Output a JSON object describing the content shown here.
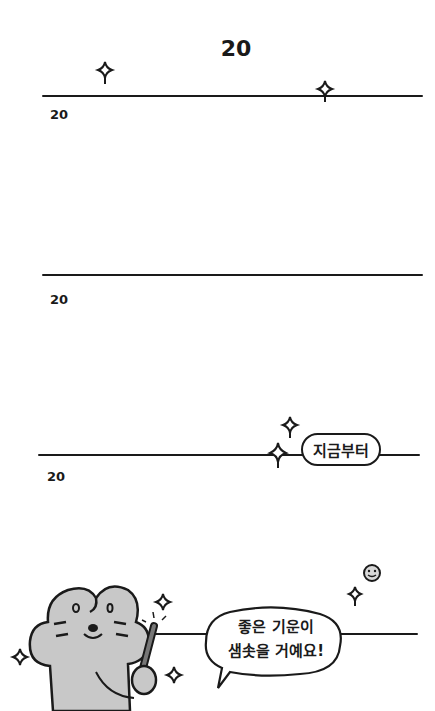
{
  "page": {
    "title": "20",
    "sections": [
      {
        "year_label": "20"
      },
      {
        "year_label": "20"
      },
      {
        "year_label": "20"
      }
    ],
    "badge": {
      "text": "지금부터"
    },
    "speech_bubble": {
      "line1": "좋은 기운이",
      "line2": "샘솟을 거예요!"
    },
    "decorations": [
      "sparkle-icon",
      "smiley-icon",
      "mouse-character-with-pen"
    ],
    "colors": {
      "ink": "#1a1a1a",
      "character_fill": "#c8c8c8",
      "background": "#ffffff"
    }
  }
}
